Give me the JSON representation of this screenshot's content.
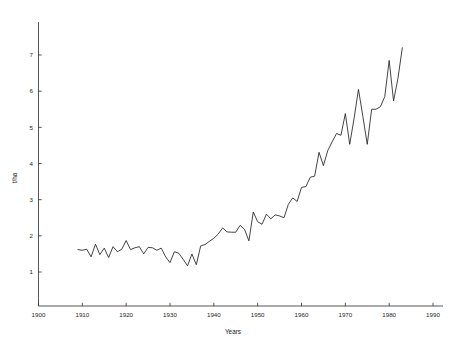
{
  "chart_data": {
    "type": "line",
    "title": "",
    "subtitle": "",
    "xlabel": "Years",
    "ylabel": "t/ha",
    "xlim": [
      1900,
      1994
    ],
    "ylim": [
      0,
      7.6
    ],
    "xticks": [
      1900,
      1910,
      1920,
      1930,
      1940,
      1950,
      1960,
      1970,
      1980,
      1990
    ],
    "xtick_labels": [
      "1900",
      "1910",
      "1920",
      "1930",
      "1940",
      "1950",
      "1960",
      "1970",
      "1980",
      "1990"
    ],
    "yticks": [
      1,
      2,
      3,
      4,
      5,
      6,
      7
    ],
    "ytick_labels": [
      "1",
      "2",
      "3",
      "4",
      "5",
      "6",
      "7"
    ],
    "grid": false,
    "legend": false,
    "legend_position": "none",
    "line_color": "#222222",
    "series": [
      {
        "name": "Yield",
        "x": [
          1909,
          1910,
          1911,
          1912,
          1913,
          1914,
          1915,
          1916,
          1917,
          1918,
          1919,
          1920,
          1921,
          1922,
          1923,
          1924,
          1925,
          1926,
          1927,
          1928,
          1929,
          1930,
          1931,
          1932,
          1933,
          1934,
          1935,
          1936,
          1937,
          1938,
          1939,
          1940,
          1941,
          1942,
          1943,
          1944,
          1945,
          1946,
          1947,
          1948,
          1949,
          1950,
          1951,
          1952,
          1953,
          1954,
          1955,
          1956,
          1957,
          1958,
          1959,
          1960,
          1961,
          1962,
          1963,
          1964,
          1965,
          1966,
          1967,
          1968,
          1969,
          1970,
          1971,
          1972,
          1973,
          1974,
          1975,
          1976,
          1977,
          1978,
          1979,
          1980,
          1981,
          1982,
          1983
        ],
        "y": [
          1.62,
          1.6,
          1.63,
          1.42,
          1.77,
          1.48,
          1.66,
          1.4,
          1.7,
          1.56,
          1.63,
          1.87,
          1.62,
          1.67,
          1.7,
          1.5,
          1.68,
          1.67,
          1.6,
          1.66,
          1.42,
          1.26,
          1.56,
          1.52,
          1.35,
          1.17,
          1.5,
          1.2,
          1.72,
          1.76,
          1.85,
          1.93,
          2.05,
          2.22,
          2.11,
          2.1,
          2.1,
          2.29,
          2.18,
          1.86,
          2.66,
          2.39,
          2.32,
          2.6,
          2.47,
          2.58,
          2.55,
          2.5,
          2.87,
          3.05,
          2.95,
          3.34,
          3.36,
          3.62,
          3.65,
          4.31,
          3.94,
          4.36,
          4.6,
          4.83,
          4.78,
          5.38,
          4.53,
          5.25,
          6.05,
          5.3,
          4.53,
          5.5,
          5.5,
          5.57,
          5.85,
          6.85,
          5.73,
          6.35,
          7.2
        ]
      }
    ]
  },
  "axis": {
    "x_title": "Years",
    "y_title": "t/ha"
  }
}
